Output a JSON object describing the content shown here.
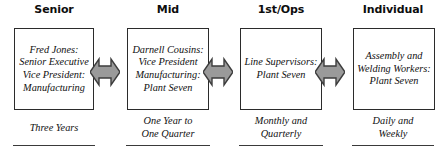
{
  "diagram": {
    "type": "horizontal-linked-boxes",
    "colors": {
      "box_border": "#2b2b2b",
      "box_fill": "#ffffff",
      "arrow_fill": "#9a9a9a",
      "arrow_stroke": "#3d3d3d",
      "text": "#111111",
      "header_text": "#0d0d0d",
      "rule": "#3a3a3a",
      "background": "#ffffff"
    },
    "columns": [
      {
        "header": "Senior",
        "box_text": "Fred Jones:\nSenior Executive\nVice President:\nManufacturing",
        "caption": "Three Years"
      },
      {
        "header": "Mid",
        "box_text": "Darnell Cousins:\nVice President\nManufacturing:\nPlant Seven",
        "caption": "One Year to\nOne Quarter"
      },
      {
        "header": "1st/Ops",
        "box_text": "Line Supervisors:\nPlant Seven",
        "caption": "Monthly and\nQuarterly"
      },
      {
        "header": "Individual",
        "box_text": "Assembly and\nWelding Workers:\nPlant Seven",
        "caption": "Daily and\nWeekly"
      }
    ],
    "connectors": [
      {
        "name": "double-arrow-senior-mid",
        "direction": "bidirectional"
      },
      {
        "name": "double-arrow-mid-firstops",
        "direction": "bidirectional"
      },
      {
        "name": "double-arrow-firstops-individual",
        "direction": "bidirectional"
      }
    ]
  }
}
